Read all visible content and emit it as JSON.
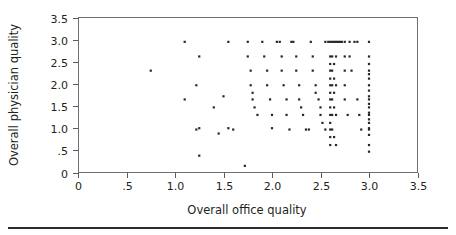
{
  "figure": {
    "name": "scatter-plot-figure",
    "background": "#ffffff",
    "ink_color": "#231f20"
  },
  "chart_data": {
    "type": "scatter",
    "title": "",
    "subtitle": "",
    "xlabel": "Overall office quality",
    "ylabel": "Overall physician quality",
    "xlim": [
      0,
      3.5
    ],
    "ylim": [
      0,
      3.5
    ],
    "xticks": [
      0,
      0.5,
      1.0,
      1.5,
      2.0,
      2.5,
      3.0,
      3.5
    ],
    "xticklabels": [
      "0",
      ".5",
      "1.0",
      "1.5",
      "2.0",
      "2.5",
      "3.0",
      "3.5"
    ],
    "yticks": [
      0,
      0.5,
      1.0,
      1.5,
      2.0,
      2.5,
      3.0,
      3.5
    ],
    "yticklabels": [
      "0",
      ".5",
      "1.0",
      "1.5",
      "2.0",
      "2.5",
      "3.0",
      "3.5"
    ],
    "grid": false,
    "legend": null,
    "marker": "square",
    "marker_size_px": 2.2,
    "marker_color": "#2a2628",
    "series": [
      {
        "name": "respondents",
        "points": [
          [
            0.75,
            2.3
          ],
          [
            1.1,
            2.95
          ],
          [
            1.1,
            1.65
          ],
          [
            1.25,
            2.62
          ],
          [
            1.22,
            1.97
          ],
          [
            1.25,
            1.0
          ],
          [
            1.22,
            0.97
          ],
          [
            1.25,
            0.38
          ],
          [
            1.4,
            1.47
          ],
          [
            1.45,
            0.88
          ],
          [
            1.5,
            1.72
          ],
          [
            1.55,
            2.95
          ],
          [
            1.55,
            1.0
          ],
          [
            1.6,
            0.97
          ],
          [
            1.72,
            0.15
          ],
          [
            1.75,
            2.95
          ],
          [
            1.75,
            2.62
          ],
          [
            1.78,
            2.3
          ],
          [
            1.78,
            1.97
          ],
          [
            1.8,
            1.8
          ],
          [
            1.8,
            1.65
          ],
          [
            1.82,
            1.47
          ],
          [
            1.85,
            1.3
          ],
          [
            1.9,
            2.95
          ],
          [
            1.92,
            2.62
          ],
          [
            1.95,
            2.3
          ],
          [
            1.95,
            1.97
          ],
          [
            1.98,
            1.65
          ],
          [
            2.0,
            1.3
          ],
          [
            2.0,
            1.0
          ],
          [
            2.05,
            2.95
          ],
          [
            2.08,
            2.95
          ],
          [
            2.1,
            2.62
          ],
          [
            2.1,
            2.3
          ],
          [
            2.12,
            1.97
          ],
          [
            2.15,
            1.65
          ],
          [
            2.15,
            1.3
          ],
          [
            2.18,
            0.97
          ],
          [
            2.2,
            2.95
          ],
          [
            2.22,
            2.95
          ],
          [
            2.25,
            2.62
          ],
          [
            2.25,
            2.3
          ],
          [
            2.28,
            1.97
          ],
          [
            2.28,
            1.65
          ],
          [
            2.3,
            1.47
          ],
          [
            2.32,
            1.3
          ],
          [
            2.35,
            0.97
          ],
          [
            2.38,
            0.97
          ],
          [
            2.4,
            2.95
          ],
          [
            2.42,
            2.62
          ],
          [
            2.42,
            2.3
          ],
          [
            2.45,
            1.97
          ],
          [
            2.45,
            1.8
          ],
          [
            2.48,
            1.65
          ],
          [
            2.5,
            1.47
          ],
          [
            2.5,
            1.3
          ],
          [
            2.52,
            1.12
          ],
          [
            2.55,
            0.97
          ],
          [
            2.55,
            2.95
          ],
          [
            2.58,
            2.95
          ],
          [
            2.6,
            2.95
          ],
          [
            2.6,
            2.62
          ],
          [
            2.6,
            2.45
          ],
          [
            2.6,
            2.3
          ],
          [
            2.6,
            2.12
          ],
          [
            2.6,
            1.97
          ],
          [
            2.6,
            1.8
          ],
          [
            2.6,
            1.65
          ],
          [
            2.6,
            1.47
          ],
          [
            2.6,
            1.3
          ],
          [
            2.6,
            1.12
          ],
          [
            2.6,
            0.97
          ],
          [
            2.6,
            0.8
          ],
          [
            2.6,
            0.62
          ],
          [
            2.62,
            2.95
          ],
          [
            2.62,
            2.62
          ],
          [
            2.62,
            2.3
          ],
          [
            2.62,
            1.97
          ],
          [
            2.62,
            1.65
          ],
          [
            2.62,
            1.3
          ],
          [
            2.62,
            0.97
          ],
          [
            2.64,
            2.95
          ],
          [
            2.64,
            2.45
          ],
          [
            2.64,
            2.12
          ],
          [
            2.64,
            1.8
          ],
          [
            2.64,
            1.47
          ],
          [
            2.64,
            0.8
          ],
          [
            2.66,
            2.95
          ],
          [
            2.66,
            2.62
          ],
          [
            2.66,
            1.97
          ],
          [
            2.66,
            1.3
          ],
          [
            2.66,
            0.62
          ],
          [
            2.68,
            2.95
          ],
          [
            2.7,
            2.95
          ],
          [
            2.72,
            2.95
          ],
          [
            2.75,
            2.95
          ],
          [
            2.75,
            2.62
          ],
          [
            2.75,
            2.3
          ],
          [
            2.75,
            1.97
          ],
          [
            2.75,
            1.65
          ],
          [
            2.78,
            1.3
          ],
          [
            2.8,
            2.95
          ],
          [
            2.8,
            2.62
          ],
          [
            2.82,
            2.3
          ],
          [
            2.85,
            2.95
          ],
          [
            2.88,
            2.95
          ],
          [
            2.88,
            1.65
          ],
          [
            2.9,
            1.3
          ],
          [
            2.92,
            0.97
          ],
          [
            3.0,
            2.95
          ],
          [
            3.0,
            2.62
          ],
          [
            3.0,
            2.45
          ],
          [
            3.0,
            2.3
          ],
          [
            3.0,
            2.22
          ],
          [
            3.0,
            2.12
          ],
          [
            3.0,
            1.97
          ],
          [
            3.0,
            1.85
          ],
          [
            3.0,
            1.72
          ],
          [
            3.0,
            1.65
          ],
          [
            3.0,
            1.55
          ],
          [
            3.0,
            1.47
          ],
          [
            3.0,
            1.35
          ],
          [
            3.0,
            1.3
          ],
          [
            3.0,
            1.2
          ],
          [
            3.0,
            1.12
          ],
          [
            3.0,
            1.0
          ],
          [
            3.0,
            0.97
          ],
          [
            3.0,
            0.85
          ],
          [
            3.0,
            0.62
          ],
          [
            3.0,
            0.47
          ]
        ]
      }
    ]
  }
}
